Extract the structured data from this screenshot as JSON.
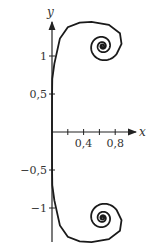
{
  "chart_data": {
    "type": "line",
    "title": "",
    "subtitle": "Euler (Cornu) spiral / clothoid",
    "xlabel": "x",
    "ylabel": "y",
    "xlim": [
      0,
      1.05
    ],
    "ylim": [
      -1.45,
      1.45
    ],
    "grid": false,
    "legend": null,
    "x_ticks": [
      0.2,
      0.4,
      0.6,
      0.8
    ],
    "x_tick_labels": [
      "",
      "0,4",
      "",
      "0,8"
    ],
    "y_ticks": [
      1,
      0.5,
      -0.5,
      -1
    ],
    "y_tick_labels": [
      "1",
      "0,5",
      "−0,5",
      "−1"
    ],
    "series": [
      {
        "name": "spiral",
        "description": "Curve symmetric about the x-axis, passing through the origin with vertical tangent, spiraling toward limit points",
        "limit_points": [
          [
            0.64,
            1.13
          ],
          [
            0.62,
            -1.13
          ]
        ],
        "max_y": 1.45,
        "max_x": 0.88
      }
    ],
    "colors": {
      "axis": "#222222",
      "curve": "#1a1a1a",
      "text": "#333333"
    }
  }
}
